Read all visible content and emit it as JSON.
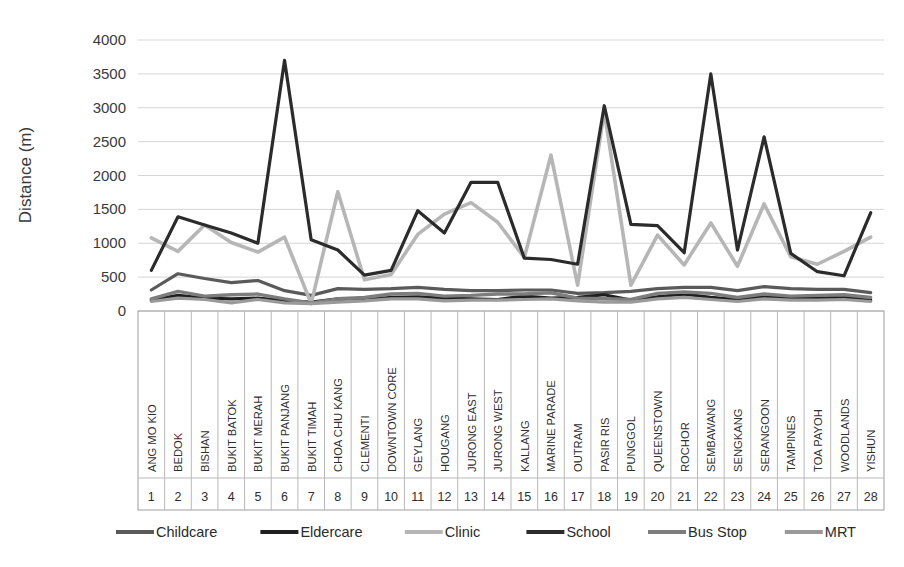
{
  "chart_data": {
    "type": "line",
    "title": "",
    "xlabel": "",
    "ylabel": "Distance (m)",
    "ylim": [
      0,
      4000
    ],
    "ytick_step": 500,
    "yticks": [
      "0",
      "500",
      "1000",
      "1500",
      "2000",
      "2500",
      "3000",
      "3500",
      "4000"
    ],
    "grid": true,
    "legend_position": "bottom",
    "categories": [
      "ANG MO KIO",
      "BEDOK",
      "BISHAN",
      "BUKIT BATOK",
      "BUKIT MERAH",
      "BUKIT PANJANG",
      "BUKIT TIMAH",
      "CHOA CHU KANG",
      "CLEMENTI",
      "DOWNTOWN CORE",
      "GEYLANG",
      "HOUGANG",
      "JURONG EAST",
      "JURONG WEST",
      "KALLANG",
      "MARINE PARADE",
      "OUTRAM",
      "PASIR RIS",
      "PUNGGOL",
      "QUEENSTOWN",
      "ROCHOR",
      "SEMBAWANG",
      "SENGKANG",
      "SERANGOON",
      "TAMPINES",
      "TOA PAYOH",
      "WOODLANDS",
      "YISHUN"
    ],
    "category_indices": [
      "1",
      "2",
      "3",
      "4",
      "5",
      "6",
      "7",
      "8",
      "9",
      "10",
      "11",
      "12",
      "13",
      "14",
      "15",
      "16",
      "17",
      "18",
      "19",
      "20",
      "21",
      "22",
      "23",
      "24",
      "25",
      "26",
      "27",
      "28"
    ],
    "series": [
      {
        "name": "Childcare",
        "color": "#5a5a5a",
        "values": [
          310,
          550,
          480,
          420,
          450,
          300,
          230,
          330,
          320,
          330,
          350,
          320,
          300,
          300,
          310,
          310,
          260,
          270,
          290,
          330,
          350,
          350,
          300,
          360,
          330,
          320,
          320,
          270
        ]
      },
      {
        "name": "Eldercare",
        "color": "#1f1f1f",
        "values": [
          160,
          230,
          190,
          180,
          190,
          150,
          130,
          180,
          170,
          200,
          210,
          190,
          180,
          170,
          220,
          190,
          200,
          240,
          160,
          210,
          250,
          200,
          170,
          210,
          190,
          190,
          200,
          160
        ]
      },
      {
        "name": "Clinic",
        "color": "#b6b6b6",
        "values": [
          1080,
          880,
          1270,
          1010,
          870,
          1090,
          110,
          1760,
          460,
          540,
          1130,
          1430,
          1600,
          1310,
          790,
          2300,
          380,
          2950,
          380,
          1120,
          680,
          1300,
          660,
          1580,
          800,
          690,
          880,
          1090
        ]
      },
      {
        "name": "School",
        "color": "#2b2b2b",
        "values": [
          600,
          1390,
          1270,
          1150,
          1000,
          3700,
          1050,
          900,
          530,
          600,
          1480,
          1150,
          1900,
          1900,
          780,
          760,
          690,
          3030,
          1280,
          1260,
          860,
          3500,
          900,
          2570,
          850,
          580,
          520,
          1450
        ]
      },
      {
        "name": "Bus Stop",
        "color": "#7d7d7d",
        "values": [
          180,
          290,
          220,
          240,
          250,
          180,
          120,
          180,
          200,
          250,
          260,
          220,
          230,
          250,
          250,
          270,
          190,
          180,
          170,
          260,
          280,
          260,
          200,
          250,
          220,
          230,
          240,
          200
        ]
      },
      {
        "name": "MRT",
        "color": "#9a9a9a",
        "values": [
          140,
          190,
          170,
          120,
          170,
          120,
          110,
          130,
          150,
          180,
          180,
          150,
          160,
          160,
          170,
          180,
          150,
          130,
          130,
          180,
          200,
          170,
          140,
          180,
          160,
          160,
          170,
          140
        ]
      }
    ]
  },
  "legend": {
    "items": [
      {
        "label": "Childcare"
      },
      {
        "label": "Eldercare"
      },
      {
        "label": "Clinic"
      },
      {
        "label": "School"
      },
      {
        "label": "Bus Stop"
      },
      {
        "label": "MRT"
      }
    ]
  }
}
